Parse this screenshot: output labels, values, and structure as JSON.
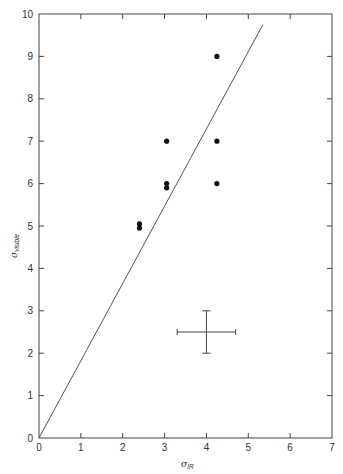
{
  "chart_data": {
    "type": "scatter",
    "title": "",
    "xlabel": "σ_IR",
    "ylabel": "σ_visible",
    "xlim": [
      0,
      7
    ],
    "ylim": [
      0,
      10
    ],
    "xticks": [
      0,
      1,
      2,
      3,
      4,
      5,
      6,
      7
    ],
    "yticks": [
      0,
      1,
      2,
      3,
      4,
      5,
      6,
      7,
      8,
      9,
      10
    ],
    "grid": false,
    "legend": null,
    "series": [
      {
        "name": "data points",
        "marker": "filled-circle",
        "points": [
          {
            "x": 2.4,
            "y": 5.05
          },
          {
            "x": 2.4,
            "y": 4.95
          },
          {
            "x": 3.05,
            "y": 7.0
          },
          {
            "x": 3.05,
            "y": 6.0
          },
          {
            "x": 3.05,
            "y": 5.9
          },
          {
            "x": 4.25,
            "y": 9.0
          },
          {
            "x": 4.25,
            "y": 7.0
          },
          {
            "x": 4.25,
            "y": 6.0
          }
        ]
      }
    ],
    "reference_line": {
      "x0": 0,
      "y0": 0,
      "x1": 5.35,
      "y1": 9.75,
      "slope": 1.82
    },
    "error_bar_key": {
      "x": 4.0,
      "y": 2.5,
      "x_err": 0.7,
      "y_err": 0.5
    }
  },
  "labels": {
    "xlabel_main": "σ",
    "xlabel_sub": "IR",
    "ylabel_main": "σ",
    "ylabel_sub": "visible"
  }
}
